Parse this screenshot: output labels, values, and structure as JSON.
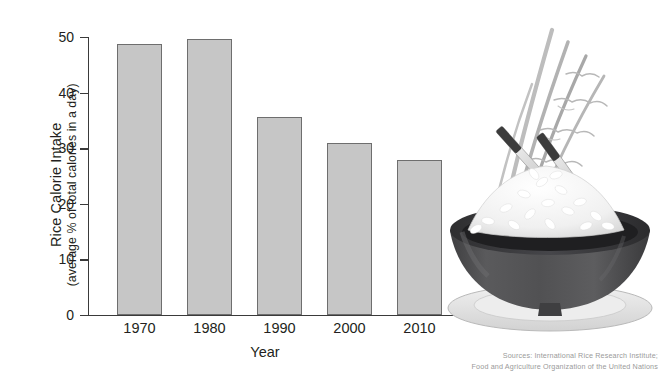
{
  "chart_data": {
    "type": "bar",
    "title": "",
    "categories": [
      "1970",
      "1980",
      "1990",
      "2000",
      "2010"
    ],
    "values": [
      48.7,
      49.7,
      35.6,
      31.0,
      27.8
    ],
    "xlabel": "Year",
    "ylabel": "Rice Calorie Intake",
    "ylabel_sub": "(average % of total calories in a day)",
    "ylim": [
      0,
      50
    ],
    "yticks": [
      0,
      10,
      20,
      30,
      40,
      50
    ],
    "ytick_labels": [
      "0",
      "10",
      "20",
      "30",
      "40",
      "50"
    ],
    "grid": false,
    "legend": null,
    "bar_fill": "#c6c6c6",
    "bar_border": "#6e6e6e",
    "axis_color": "#3a3a3a",
    "background": "#ffffff"
  },
  "source": {
    "line1": "Sources: International Rice Research Institute;",
    "line2": "Food and Agriculture Organization of the United Nations"
  },
  "illustration": {
    "name": "bowl-of-rice-with-chopsticks-and-rice-stalks",
    "bowl_color": "#4a4a4c",
    "rice_color": "#f4f4f4",
    "plate_color": "#e3e3e3",
    "stalk_color": "#b0b0b0",
    "chopstick_color": "#d4d4d4",
    "chopstick_tip_color": "#3c3c3c"
  }
}
